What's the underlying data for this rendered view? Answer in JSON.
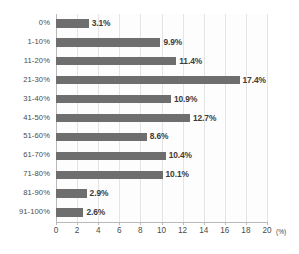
{
  "chart_data": {
    "type": "bar",
    "orientation": "horizontal",
    "title": "",
    "subtitle": "",
    "xlabel": "(%)",
    "ylabel": "",
    "xlim": [
      0,
      20
    ],
    "ylim": null,
    "grid": true,
    "legend": null,
    "legend_position": "none",
    "x_unit": "(%)",
    "xticks": [
      "0",
      "2",
      "4",
      "6",
      "8",
      "10",
      "12",
      "14",
      "16",
      "18",
      "20"
    ],
    "xtick_values": [
      0,
      2,
      4,
      6,
      8,
      10,
      12,
      14,
      16,
      18,
      20
    ],
    "categories": [
      "0%",
      "1-10%",
      "11-20%",
      "21-30%",
      "31-40%",
      "41-50%",
      "51-60%",
      "61-70%",
      "71-80%",
      "81-90%",
      "91-100%"
    ],
    "values": [
      3.1,
      9.9,
      11.4,
      17.4,
      10.9,
      12.7,
      8.6,
      10.4,
      10.1,
      2.9,
      2.6
    ],
    "data_labels": [
      "3.1%",
      "9.9%",
      "11.4%",
      "17.4%",
      "10.9%",
      "12.7%",
      "8.6%",
      "10.4%",
      "10.1%",
      "2.9%",
      "2.6%"
    ],
    "colors": {
      "bar": "#6e6e6e",
      "gridline": "#e4e4e4",
      "axis": "#b9b9b9",
      "label_text": "#4a4a4a",
      "value_text": "#3b3b3b",
      "background": "#ffffff",
      "plot_background": "#fdfdfd"
    }
  }
}
